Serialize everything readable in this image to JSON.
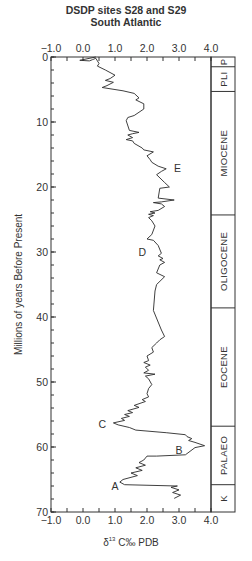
{
  "chart_data": {
    "type": "line",
    "title": "DSDP sites S28 and S29",
    "subtitle": "South Atlantic",
    "xlabel": "δ13C‰ PDB",
    "ylabel": "Millions of years Before Present",
    "xlim": [
      -1.0,
      4.0
    ],
    "ylim": [
      0,
      70
    ],
    "y_inverted": true,
    "x_ticks": [
      "-1.0",
      "0.0",
      "1.0",
      "2.0",
      "3.0",
      "4.0"
    ],
    "x_tick_values": [
      -1.0,
      0.0,
      1.0,
      2.0,
      3.0,
      4.0
    ],
    "y_ticks": [
      "0",
      "10",
      "20",
      "30",
      "40",
      "50",
      "60",
      "70"
    ],
    "y_tick_values": [
      0,
      10,
      20,
      30,
      40,
      50,
      60,
      70
    ],
    "grid": false,
    "series": [
      {
        "name": "δ13C",
        "points": [
          [
            0.4,
            0.0
          ],
          [
            -0.1,
            0.5
          ],
          [
            0.2,
            0.6
          ],
          [
            0.3,
            0.4
          ],
          [
            0.4,
            0.2
          ],
          [
            0.5,
            1.0
          ],
          [
            0.45,
            1.4
          ],
          [
            0.7,
            2.0
          ],
          [
            1.0,
            2.8
          ],
          [
            0.85,
            3.3
          ],
          [
            0.7,
            3.6
          ],
          [
            0.95,
            3.9
          ],
          [
            0.75,
            4.4
          ],
          [
            0.6,
            4.7
          ],
          [
            1.25,
            5.2
          ],
          [
            1.6,
            5.6
          ],
          [
            1.75,
            6.3
          ],
          [
            1.65,
            6.6
          ],
          [
            1.9,
            7.2
          ],
          [
            1.9,
            8.0
          ],
          [
            1.6,
            9.0
          ],
          [
            1.4,
            9.3
          ],
          [
            1.35,
            9.8
          ],
          [
            1.45,
            11.3
          ],
          [
            1.75,
            11.6
          ],
          [
            1.55,
            11.8
          ],
          [
            1.4,
            12.0
          ],
          [
            1.55,
            12.4
          ],
          [
            1.35,
            12.7
          ],
          [
            1.55,
            12.9
          ],
          [
            1.6,
            13.3
          ],
          [
            1.85,
            14.0
          ],
          [
            1.9,
            14.3
          ],
          [
            2.2,
            14.6
          ],
          [
            2.0,
            15.2
          ],
          [
            2.1,
            15.8
          ],
          [
            2.15,
            16.2
          ],
          [
            2.35,
            16.8
          ],
          [
            2.6,
            17.2
          ],
          [
            2.45,
            17.6
          ],
          [
            2.3,
            18.1
          ],
          [
            2.55,
            19.3
          ],
          [
            2.7,
            20.0
          ],
          [
            2.4,
            20.2
          ],
          [
            2.35,
            21.7
          ],
          [
            2.85,
            22.0
          ],
          [
            2.45,
            22.3
          ],
          [
            2.2,
            22.4
          ],
          [
            2.45,
            22.6
          ],
          [
            2.55,
            23.0
          ],
          [
            2.35,
            23.6
          ],
          [
            2.1,
            23.8
          ],
          [
            2.25,
            24.0
          ],
          [
            2.05,
            24.2
          ],
          [
            2.2,
            24.4
          ],
          [
            2.05,
            24.7
          ],
          [
            2.15,
            25.2
          ],
          [
            2.25,
            26.0
          ],
          [
            2.15,
            27.3
          ],
          [
            2.0,
            28.0
          ],
          [
            2.2,
            28.2
          ],
          [
            2.35,
            29.0
          ],
          [
            2.45,
            30.2
          ],
          [
            2.35,
            30.6
          ],
          [
            2.5,
            31.0
          ],
          [
            2.4,
            31.2
          ],
          [
            2.55,
            31.6
          ],
          [
            2.4,
            32.0
          ],
          [
            2.3,
            33.2
          ],
          [
            2.55,
            33.8
          ],
          [
            2.3,
            35.0
          ],
          [
            2.25,
            36.0
          ],
          [
            2.2,
            39.0
          ],
          [
            2.45,
            42.0
          ],
          [
            2.55,
            43.0
          ],
          [
            2.4,
            43.5
          ],
          [
            2.3,
            44.0
          ],
          [
            2.15,
            44.7
          ],
          [
            2.2,
            45.4
          ],
          [
            2.0,
            46.0
          ],
          [
            2.05,
            46.7
          ],
          [
            1.9,
            47.0
          ],
          [
            2.1,
            47.4
          ],
          [
            1.95,
            47.7
          ],
          [
            2.05,
            48.2
          ],
          [
            1.9,
            48.6
          ],
          [
            2.25,
            48.8
          ],
          [
            1.95,
            49.1
          ],
          [
            2.05,
            49.5
          ],
          [
            2.15,
            50.4
          ],
          [
            2.05,
            51.0
          ],
          [
            2.0,
            51.8
          ],
          [
            2.05,
            52.3
          ],
          [
            1.85,
            52.7
          ],
          [
            1.95,
            53.0
          ],
          [
            1.6,
            53.6
          ],
          [
            1.75,
            53.9
          ],
          [
            1.4,
            54.4
          ],
          [
            1.55,
            54.7
          ],
          [
            1.3,
            55.0
          ],
          [
            1.45,
            55.3
          ],
          [
            1.2,
            55.6
          ],
          [
            1.3,
            55.9
          ],
          [
            0.95,
            56.3
          ],
          [
            1.1,
            56.6
          ],
          [
            1.45,
            57.0
          ],
          [
            1.65,
            57.4
          ],
          [
            2.6,
            57.8
          ],
          [
            3.2,
            58.1
          ],
          [
            3.25,
            58.4
          ],
          [
            3.4,
            58.7
          ],
          [
            3.3,
            59.0
          ],
          [
            3.5,
            59.3
          ],
          [
            3.8,
            59.8
          ],
          [
            3.5,
            60.1
          ],
          [
            3.2,
            61.2
          ],
          [
            2.3,
            61.4
          ],
          [
            2.0,
            61.4
          ],
          [
            1.9,
            62.0
          ],
          [
            1.75,
            62.4
          ],
          [
            1.95,
            62.8
          ],
          [
            1.65,
            63.2
          ],
          [
            1.85,
            63.6
          ],
          [
            1.5,
            64.0
          ],
          [
            1.7,
            64.4
          ],
          [
            1.25,
            65.0
          ],
          [
            1.15,
            65.4
          ],
          [
            1.3,
            65.8
          ],
          [
            2.95,
            66.0
          ],
          [
            2.75,
            66.2
          ],
          [
            3.0,
            66.6
          ],
          [
            2.8,
            67.0
          ],
          [
            3.05,
            67.4
          ],
          [
            2.85,
            67.9
          ]
        ]
      }
    ],
    "annotations": [
      {
        "label": "A",
        "x": 1.0,
        "y": 66.0
      },
      {
        "label": "B",
        "x": 3.0,
        "y": 60.5
      },
      {
        "label": "C",
        "x": 0.6,
        "y": 56.5
      },
      {
        "label": "D",
        "x": 1.85,
        "y": 30.0
      },
      {
        "label": "E",
        "x": 2.95,
        "y": 17.0
      }
    ],
    "epochs": [
      {
        "label": "P",
        "start": 0.0,
        "end": 1.5
      },
      {
        "label": "PLI",
        "start": 1.5,
        "end": 5.3
      },
      {
        "label": "MIOCENE",
        "start": 5.3,
        "end": 24.3
      },
      {
        "label": "OLIGOCENE",
        "start": 24.3,
        "end": 38.6
      },
      {
        "label": "EOCENE",
        "start": 38.6,
        "end": 56.8
      },
      {
        "label": "PALAEO",
        "start": 56.8,
        "end": 65.8
      },
      {
        "label": "K",
        "start": 65.8,
        "end": 70.0
      }
    ]
  }
}
